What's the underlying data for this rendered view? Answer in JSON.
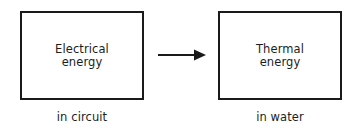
{
  "diagram": {
    "type": "energy-transfer-flow",
    "background_color": "#ffffff",
    "stroke_color": "#1a1a1a",
    "text_color": "#1d1d1d",
    "source": {
      "box_label": "Electrical\nenergy",
      "caption": "in circuit"
    },
    "arrow": {
      "icon_name": "right-arrow-icon",
      "direction": "left-to-right"
    },
    "target": {
      "box_label": "Thermal\nenergy",
      "caption": "in water"
    }
  }
}
